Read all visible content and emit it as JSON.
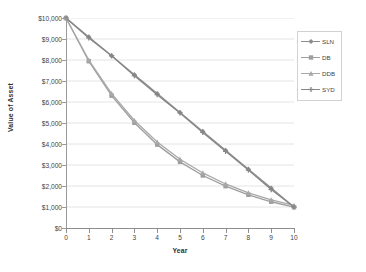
{
  "chart_data": {
    "type": "line",
    "title": "",
    "xlabel": "Year",
    "ylabel": "Value of Asset",
    "x": [
      0,
      1,
      2,
      3,
      4,
      5,
      6,
      7,
      8,
      9,
      10
    ],
    "xtick_labels": [
      "0",
      "1",
      "2",
      "3",
      "4",
      "5",
      "6",
      "7",
      "8",
      "9",
      "10"
    ],
    "ytick_labels": [
      "$0",
      "$1,000",
      "$2,000",
      "$3,000",
      "$4,000",
      "$5,000",
      "$6,000",
      "$7,000",
      "$8,000",
      "$9,000",
      "$10,000"
    ],
    "ytick_values": [
      0,
      1000,
      2000,
      3000,
      4000,
      5000,
      6000,
      7000,
      8000,
      9000,
      10000
    ],
    "xlim": [
      0,
      10
    ],
    "ylim": [
      0,
      10000
    ],
    "grid": "horizontal",
    "legend_position": "top-right",
    "series": [
      {
        "name": "SLN",
        "marker": "diamond",
        "color": "#8c8c8c",
        "values": [
          10000,
          9100,
          8200,
          7300,
          6400,
          5500,
          4600,
          3700,
          2800,
          1900,
          1000
        ]
      },
      {
        "name": "DB",
        "marker": "square",
        "color": "#9e9e9e",
        "values": [
          10000,
          7940,
          6300,
          5010,
          3970,
          3150,
          2500,
          1990,
          1580,
          1250,
          990
        ]
      },
      {
        "name": "DDB",
        "marker": "triangle",
        "color": "#a8a8a8",
        "values": [
          10000,
          8000,
          6400,
          5120,
          4096,
          3277,
          2621,
          2097,
          1678,
          1342,
          1074
        ]
      },
      {
        "name": "SYD",
        "marker": "cross",
        "color": "#878787",
        "values": [
          10000,
          9050,
          8200,
          7250,
          6350,
          5480,
          4550,
          3650,
          2760,
          1830,
          1000
        ]
      }
    ]
  }
}
